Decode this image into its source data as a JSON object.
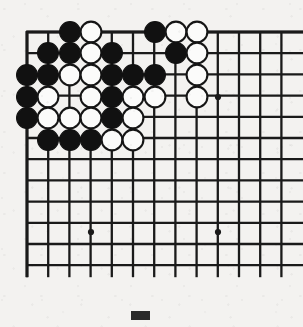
{
  "figure": {
    "board_type": "go-board",
    "caption_marker": "solid-black-rectangle"
  },
  "board": {
    "columns": 13,
    "rows": 12,
    "origin_x": 27,
    "origin_y": 32,
    "spacing": 21.2,
    "line_color": "#1a1a1a",
    "background_color": "#f3f2f0",
    "black_color": "#111111",
    "white_color": "#fbfbfa",
    "stone_radius": 10.4,
    "edges": {
      "top": "board-edge",
      "left": "board-edge",
      "right": "cut-off",
      "bottom": "cut-off"
    },
    "star_points": [
      {
        "col": 10,
        "row": 4,
        "x": 218,
        "y": 97
      },
      {
        "col": 4,
        "row": 10,
        "x": 91,
        "y": 232
      },
      {
        "col": 10,
        "row": 10,
        "x": 218,
        "y": 232
      }
    ],
    "stones": [
      {
        "color": "black",
        "col": 3,
        "row": 1,
        "x": 70,
        "y": 32
      },
      {
        "color": "white",
        "col": 4,
        "row": 1,
        "x": 91,
        "y": 32
      },
      {
        "color": "black",
        "col": 7,
        "row": 1,
        "x": 155,
        "y": 32
      },
      {
        "color": "white",
        "col": 8,
        "row": 1,
        "x": 176,
        "y": 32
      },
      {
        "color": "white",
        "col": 9,
        "row": 1,
        "x": 197,
        "y": 32
      },
      {
        "color": "black",
        "col": 2,
        "row": 2,
        "x": 48,
        "y": 53
      },
      {
        "color": "black",
        "col": 3,
        "row": 2,
        "x": 70,
        "y": 53
      },
      {
        "color": "white",
        "col": 4,
        "row": 2,
        "x": 91,
        "y": 53
      },
      {
        "color": "black",
        "col": 5,
        "row": 2,
        "x": 112,
        "y": 53
      },
      {
        "color": "black",
        "col": 8,
        "row": 2,
        "x": 176,
        "y": 53
      },
      {
        "color": "white",
        "col": 9,
        "row": 2,
        "x": 197,
        "y": 53
      },
      {
        "color": "black",
        "col": 1,
        "row": 3,
        "x": 27,
        "y": 75
      },
      {
        "color": "black",
        "col": 2,
        "row": 3,
        "x": 48,
        "y": 75
      },
      {
        "color": "white",
        "col": 3,
        "row": 3,
        "x": 70,
        "y": 75
      },
      {
        "color": "white",
        "col": 4,
        "row": 3,
        "x": 91,
        "y": 75
      },
      {
        "color": "black",
        "col": 5,
        "row": 3,
        "x": 112,
        "y": 75
      },
      {
        "color": "black",
        "col": 6,
        "row": 3,
        "x": 133,
        "y": 75
      },
      {
        "color": "black",
        "col": 7,
        "row": 3,
        "x": 155,
        "y": 75
      },
      {
        "color": "white",
        "col": 9,
        "row": 3,
        "x": 197,
        "y": 75
      },
      {
        "color": "black",
        "col": 1,
        "row": 4,
        "x": 27,
        "y": 97
      },
      {
        "color": "white",
        "col": 2,
        "row": 4,
        "x": 48,
        "y": 97
      },
      {
        "color": "white",
        "col": 4,
        "row": 4,
        "x": 91,
        "y": 97
      },
      {
        "color": "black",
        "col": 5,
        "row": 4,
        "x": 112,
        "y": 97
      },
      {
        "color": "white",
        "col": 6,
        "row": 4,
        "x": 133,
        "y": 97
      },
      {
        "color": "white",
        "col": 7,
        "row": 4,
        "x": 155,
        "y": 97
      },
      {
        "color": "white",
        "col": 9,
        "row": 4,
        "x": 197,
        "y": 97
      },
      {
        "color": "black",
        "col": 1,
        "row": 5,
        "x": 27,
        "y": 118
      },
      {
        "color": "white",
        "col": 2,
        "row": 5,
        "x": 48,
        "y": 118
      },
      {
        "color": "white",
        "col": 3,
        "row": 5,
        "x": 70,
        "y": 118
      },
      {
        "color": "white",
        "col": 4,
        "row": 5,
        "x": 91,
        "y": 118
      },
      {
        "color": "black",
        "col": 5,
        "row": 5,
        "x": 112,
        "y": 118
      },
      {
        "color": "white",
        "col": 6,
        "row": 5,
        "x": 133,
        "y": 118
      },
      {
        "color": "black",
        "col": 2,
        "row": 6,
        "x": 48,
        "y": 140
      },
      {
        "color": "black",
        "col": 3,
        "row": 6,
        "x": 70,
        "y": 140
      },
      {
        "color": "black",
        "col": 4,
        "row": 6,
        "x": 91,
        "y": 140
      },
      {
        "color": "white",
        "col": 5,
        "row": 6,
        "x": 112,
        "y": 140
      },
      {
        "color": "white",
        "col": 6,
        "row": 6,
        "x": 133,
        "y": 140
      }
    ]
  }
}
